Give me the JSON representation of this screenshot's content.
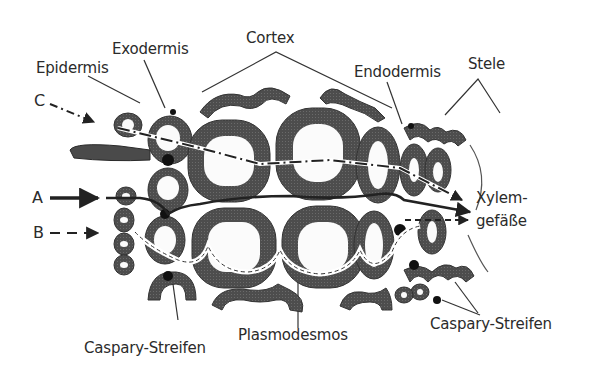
{
  "figure": {
    "type": "root cross-section water transport pathways",
    "colors": {
      "background": "#ffffff",
      "cell_wall": "#4a4a4a",
      "lumen": "#fbfbfb",
      "caspary_strip": "#111111",
      "text": "#2b2b2b"
    }
  },
  "labels": {
    "epidermis": "Epidermis",
    "exodermis": "Exodermis",
    "cortex": "Cortex",
    "endodermis": "Endodermis",
    "stele": "Stele",
    "xylem_line1": "Xylem-",
    "xylem_line2": "gefäße",
    "caspary_left": "Caspary-Streifen",
    "plasmodesmos": "Plasmodesmos",
    "caspary_right": "Caspary-Streifen"
  },
  "pathways": [
    {
      "id": "A",
      "label": "A",
      "style": "solid",
      "description": "solid arrow"
    },
    {
      "id": "B",
      "label": "B",
      "style": "dashed",
      "description": "dashed arrow"
    },
    {
      "id": "C",
      "label": "C",
      "style": "dash-dot",
      "description": "dash-dot arrow"
    }
  ]
}
